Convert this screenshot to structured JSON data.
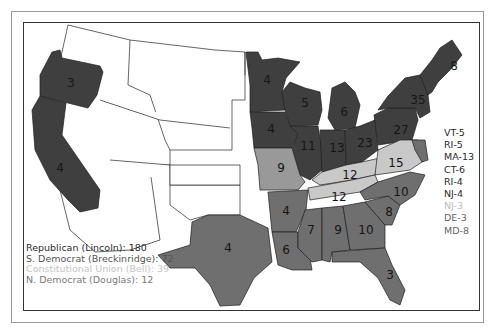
{
  "colors": {
    "republican": "#3f3f3f",
    "southern_democrat": "#6f6f6f",
    "constitutional_union": "#c9c9c9",
    "northern_democrat": "#999999",
    "no_vote": "#ffffff",
    "legend_text_dark": "#2a2a2a",
    "legend_text_light": "#bdbdbd"
  },
  "legend": [
    {
      "label": "Republican (Lincoln): 180",
      "party": "republican"
    },
    {
      "label": "S. Democrat (Breckinridge): 72",
      "party": "southern_democrat"
    },
    {
      "label": "Constitutional Union (Bell): 39",
      "party": "constitutional_union"
    },
    {
      "label": "N. Democrat (Douglas): 12",
      "party": "northern_democrat"
    }
  ],
  "small_states": [
    {
      "label": "VT-5",
      "party": "republican"
    },
    {
      "label": "RI-5",
      "party": "republican"
    },
    {
      "label": "MA-13",
      "party": "republican"
    },
    {
      "label": "CT-6",
      "party": "republican"
    },
    {
      "label": "RI-4",
      "party": "republican"
    },
    {
      "label": "NJ-4",
      "party": "republican"
    },
    {
      "label": "NJ-3",
      "party": "northern_democrat"
    },
    {
      "label": "DE-3",
      "party": "southern_democrat"
    },
    {
      "label": "MD-8",
      "party": "southern_democrat"
    }
  ],
  "state_labels": {
    "OR": "3",
    "CA": "4",
    "MN": "4",
    "WI": "5",
    "MI": "6",
    "IA": "4",
    "IL": "11",
    "IN": "13",
    "OH": "23",
    "PA": "27",
    "NY": "35",
    "ME": "8",
    "MO": "9",
    "KY": "12",
    "VA": "15",
    "TN": "12",
    "NC": "10",
    "AR": "4",
    "TX": "4",
    "LA": "6",
    "MS": "7",
    "AL": "9",
    "GA": "10",
    "SC": "8",
    "FL": "3"
  }
}
